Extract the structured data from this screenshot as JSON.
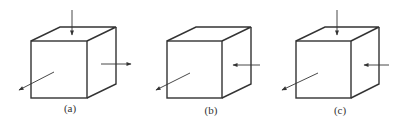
{
  "figure": {
    "panels": [
      {
        "label": "(a)",
        "arrows": [
          "top-pointing-down",
          "right-pointing-outward",
          "front-diagonal-pointing-outward"
        ]
      },
      {
        "label": "(b)",
        "arrows": [
          "right-pointing-inward",
          "front-diagonal-pointing-outward"
        ]
      },
      {
        "label": "(c)",
        "arrows": [
          "top-pointing-down",
          "right-pointing-inward",
          "front-diagonal-pointing-outward"
        ]
      }
    ],
    "colors": {
      "line": "#333333",
      "background": "#ffffff"
    }
  }
}
